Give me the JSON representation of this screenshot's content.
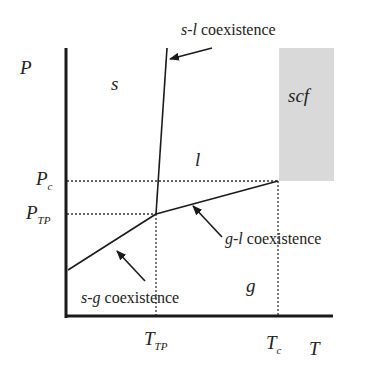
{
  "diagram": {
    "axes": {
      "x_label": "T",
      "y_label": "P",
      "x_ticks": [
        {
          "main": "T",
          "sub": "TP"
        },
        {
          "main": "T",
          "sub": "c"
        }
      ],
      "y_ticks": [
        {
          "main": "P",
          "sub": "c"
        },
        {
          "main": "P",
          "sub": "TP"
        }
      ]
    },
    "regions": {
      "solid": "s",
      "liquid": "l",
      "gas": "g",
      "supercritical": "scf"
    },
    "annotations": {
      "sl": {
        "prefix": "s-l",
        "suffix": " coexistence"
      },
      "gl": {
        "prefix": "g-l",
        "suffix": " coexistence"
      },
      "sg": {
        "prefix": "s-g",
        "suffix": " coexistence"
      }
    },
    "colors": {
      "line": "#1a1a1a",
      "scf_fill": "#d9d9d9",
      "background": "#ffffff"
    }
  }
}
